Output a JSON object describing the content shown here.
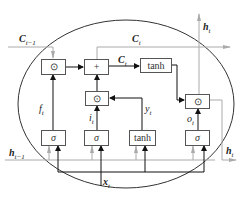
{
  "diagram": {
    "type": "LSTM cell",
    "labels": {
      "c_prev": "C",
      "c_prev_sub": "t−1",
      "c_t_top": "C",
      "c_t_top_sub": "t",
      "c_t_mid": "C",
      "c_t_mid_sub": "t",
      "h_t_top": "h",
      "h_t_top_sub": "t",
      "h_t_right": "h",
      "h_t_right_sub": "t",
      "h_prev": "h",
      "h_prev_sub": "t−1",
      "x_t": "x",
      "x_t_sub": "t",
      "f_t": "f",
      "f_t_sub": "t",
      "i_t": "i",
      "i_t_sub": "t",
      "y_t": "y",
      "y_t_sub": "t",
      "o_t": "o",
      "o_t_sub": "t"
    },
    "boxes": {
      "forget_mult": "⊙",
      "cell_add": "+",
      "cell_tanh": "tanh",
      "input_mult": "⊙",
      "output_mult": "⊙",
      "forget_sigma": "σ",
      "input_sigma": "σ",
      "candidate_tanh": "tanh",
      "output_sigma": "σ"
    }
  }
}
